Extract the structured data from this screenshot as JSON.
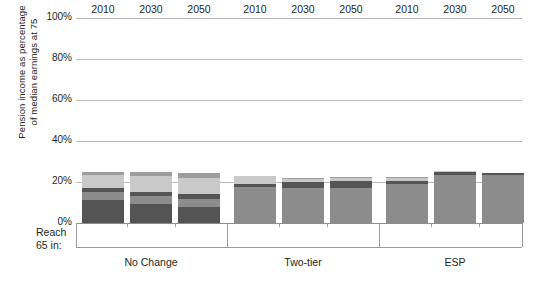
{
  "chart_data": {
    "type": "bar",
    "subtype": "stacked-bar-grouped",
    "title": "",
    "xlabel": "Reach 65 in:",
    "ylabel": "Pension income as percentage\nof median earnings at 75",
    "ylim": [
      0,
      100
    ],
    "yticks": [
      0,
      20,
      40,
      60,
      80,
      100
    ],
    "ytick_labels": [
      "0%",
      "20%",
      "40%",
      "60%",
      "80%",
      "100%"
    ],
    "grid": true,
    "legend": "none",
    "groups": [
      "No Change",
      "Two-tier",
      "ESP"
    ],
    "categories": [
      "2010",
      "2030",
      "2050",
      "2010",
      "2030",
      "2050",
      "2010",
      "2030",
      "2050"
    ],
    "series": [
      {
        "name": "Segment 1 (bottom, dark)",
        "color": "#545454",
        "values": [
          11.0,
          9.5,
          8.0,
          0.0,
          0.0,
          0.0,
          0.0,
          0.0,
          0.0
        ]
      },
      {
        "name": "Segment 2 (mid, medium grey)",
        "color": "#8c8c8c",
        "values": [
          4.0,
          3.5,
          3.5,
          17.5,
          17.0,
          17.0,
          19.0,
          23.5,
          23.5
        ]
      },
      {
        "name": "Segment 3 (dark band)",
        "color": "#555555",
        "values": [
          2.0,
          2.0,
          2.5,
          1.5,
          3.0,
          3.5,
          1.5,
          1.5,
          1.0
        ]
      },
      {
        "name": "Segment 4 (light grey top)",
        "color": "#c9c9c9",
        "values": [
          6.5,
          8.0,
          8.0,
          4.0,
          1.5,
          1.5,
          1.5,
          0.5,
          0.0
        ]
      },
      {
        "name": "Segment 5 (cap, medium grey)",
        "color": "#9d9d9d",
        "values": [
          1.5,
          2.0,
          2.5,
          0.0,
          0.5,
          0.5,
          0.5,
          0.0,
          0.0
        ]
      }
    ],
    "totals": [
      25.0,
      25.0,
      24.5,
      23.0,
      22.0,
      22.5,
      22.5,
      25.5,
      24.5
    ],
    "colors": {
      "gridline": "#b9b9b9",
      "axis": "#9a9a9a",
      "text": "#231f20",
      "background": "#ffffff"
    }
  },
  "axis": {
    "row_label": "Reach\n65 in:",
    "years": [
      "2010",
      "2030",
      "2050",
      "2010",
      "2030",
      "2050",
      "2010",
      "2030",
      "2050"
    ],
    "groups": [
      "No Change",
      "Two-tier",
      "ESP"
    ]
  }
}
